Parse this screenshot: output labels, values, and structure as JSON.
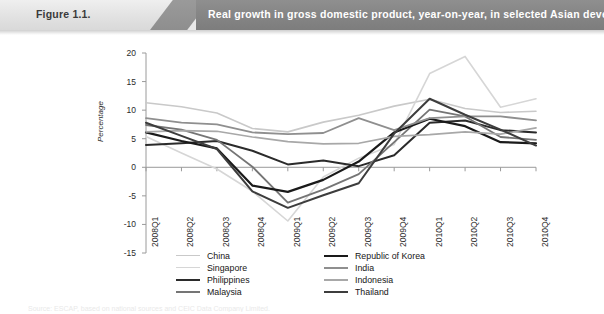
{
  "header": {
    "figure_number": "Figure 1.1.",
    "title": "Real growth in gross domestic product, year-on-year, in selected Asian developing economies, 2008-2010"
  },
  "source_note": "Source: ESCAP, based on national sources and CEIC Data Company Limited.",
  "chart_data": {
    "type": "line",
    "title": "Real growth in gross domestic product, year-on-year, in selected Asian developing economies, 2008-2010",
    "xlabel": "",
    "ylabel": "Percentage",
    "ylim": [
      -15,
      20
    ],
    "yticks": [
      20,
      15,
      10,
      5,
      0,
      -5,
      -10,
      -15
    ],
    "grid": false,
    "legend_position": "bottom",
    "categories": [
      "2008Q1",
      "2008Q2",
      "2008Q3",
      "2008Q4",
      "2009Q1",
      "2009Q2",
      "2009Q3",
      "2009Q4",
      "2010Q1",
      "2010Q2",
      "2010Q3",
      "2010Q4"
    ],
    "series": [
      {
        "name": "China",
        "color": "#c9c9c9",
        "width": 1.6,
        "values": [
          11.3,
          10.6,
          9.5,
          6.8,
          6.2,
          7.9,
          9.1,
          10.7,
          11.9,
          10.3,
          9.6,
          9.8
        ]
      },
      {
        "name": "Singapore",
        "color": "#d6d6d6",
        "width": 1.6,
        "values": [
          5.4,
          2.5,
          -0.3,
          -4.2,
          -9.4,
          -1.7,
          1.6,
          4.0,
          16.4,
          19.4,
          10.5,
          12.0
        ]
      },
      {
        "name": "Philippines",
        "color": "#2b2b2b",
        "width": 2.0,
        "values": [
          3.9,
          4.2,
          4.6,
          2.9,
          0.5,
          1.2,
          0.2,
          2.1,
          7.8,
          8.2,
          6.5,
          6.1
        ]
      },
      {
        "name": "Malaysia",
        "color": "#757575",
        "width": 1.8,
        "values": [
          7.4,
          6.6,
          4.8,
          0.1,
          -6.2,
          -3.9,
          -1.2,
          4.4,
          10.1,
          8.9,
          5.3,
          4.8
        ]
      },
      {
        "name": "Republic of Korea",
        "color": "#1a1a1a",
        "width": 2.2,
        "values": [
          6.1,
          4.6,
          3.3,
          -3.2,
          -4.3,
          -2.2,
          1.0,
          6.1,
          8.5,
          7.2,
          4.4,
          4.2
        ]
      },
      {
        "name": "India",
        "color": "#8f8f8f",
        "width": 1.8,
        "values": [
          8.6,
          7.8,
          7.5,
          6.1,
          5.8,
          6.0,
          8.6,
          6.5,
          8.6,
          8.9,
          8.9,
          8.2
        ]
      },
      {
        "name": "Indonesia",
        "color": "#a8a8a8",
        "width": 1.7,
        "values": [
          6.2,
          6.4,
          6.3,
          5.3,
          4.5,
          4.1,
          4.2,
          5.4,
          5.7,
          6.2,
          5.8,
          6.9
        ]
      },
      {
        "name": "Thailand",
        "color": "#3d3d3d",
        "width": 2.0,
        "values": [
          7.8,
          5.5,
          3.2,
          -4.2,
          -7.1,
          -4.9,
          -2.8,
          5.9,
          12.0,
          9.2,
          6.6,
          3.8
        ]
      }
    ]
  },
  "legend": {
    "left_column": [
      "China",
      "Singapore",
      "Philippines",
      "Malaysia"
    ],
    "right_column": [
      "Republic of Korea",
      "India",
      "Indonesia",
      "Thailand"
    ]
  }
}
